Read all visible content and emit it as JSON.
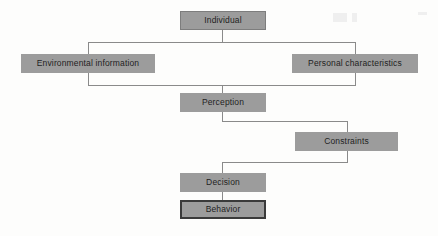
{
  "diagram": {
    "type": "flowchart",
    "background_color": "#fdfdfc",
    "box_fill_color": "#9c9c9c",
    "box_border_color": "#7d7d7d",
    "emphasis_border_color": "#3a3a3a",
    "connector_color": "#8a8a8a",
    "nodes": [
      {
        "id": "individual",
        "label": "Individual",
        "x": 180,
        "y": 11,
        "w": 86,
        "h": 19,
        "style": "bordered"
      },
      {
        "id": "environmental-information",
        "label": "Environmental information",
        "x": 21,
        "y": 54,
        "w": 134,
        "h": 19,
        "style": "plain"
      },
      {
        "id": "personal-characteristics",
        "label": "Personal characteristics",
        "x": 292,
        "y": 54,
        "w": 126,
        "h": 19,
        "style": "plain"
      },
      {
        "id": "perception",
        "label": "Perception",
        "x": 180,
        "y": 93,
        "w": 86,
        "h": 19,
        "style": "plain"
      },
      {
        "id": "constraints",
        "label": "Constraints",
        "x": 295,
        "y": 132,
        "w": 103,
        "h": 19,
        "style": "plain"
      },
      {
        "id": "decision",
        "label": "Decision",
        "x": 180,
        "y": 173,
        "w": 86,
        "h": 19,
        "style": "plain"
      },
      {
        "id": "behavior",
        "label": "Behavior",
        "x": 180,
        "y": 200,
        "w": 86,
        "h": 19,
        "style": "bordered-emphasis"
      }
    ],
    "edges": [
      {
        "id": "individual-to-split",
        "from": "individual",
        "to": "split-bus"
      },
      {
        "id": "split-to-environmental",
        "from": "split-bus",
        "to": "environmental-information"
      },
      {
        "id": "split-to-personal",
        "from": "split-bus",
        "to": "personal-characteristics"
      },
      {
        "id": "merge-to-perception",
        "from": "merge-bus",
        "to": "perception"
      },
      {
        "id": "perception-to-constraints",
        "from": "perception",
        "to": "constraints"
      },
      {
        "id": "constraints-to-decision",
        "from": "constraints",
        "to": "decision"
      },
      {
        "id": "decision-to-behavior",
        "from": "decision",
        "to": "behavior"
      }
    ]
  }
}
